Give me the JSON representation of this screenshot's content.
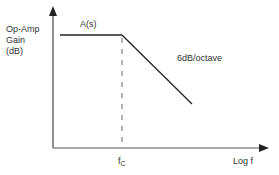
{
  "diagram": {
    "y_axis": {
      "label_lines": [
        "Op-Amp",
        "Gain",
        "(dB)"
      ]
    },
    "x_axis": {
      "label": "Log f"
    },
    "curve": {
      "label": "A(s)"
    },
    "slope": {
      "label": "6dB/octave"
    },
    "corner_frequency": {
      "symbol": "f",
      "subscript": "C"
    },
    "colors": {
      "line": "#222222",
      "text": "#333333",
      "background": "#ffffff"
    }
  }
}
